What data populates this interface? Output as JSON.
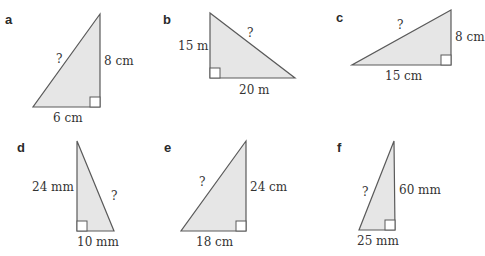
{
  "colors": {
    "triangle_fill": "#e6e6e6",
    "triangle_stroke": "#5a5a5a",
    "text": "#333333"
  },
  "problems": [
    {
      "label": "a",
      "hypotenuse": "?",
      "leg_vertical": "8 cm",
      "leg_horizontal": "6 cm"
    },
    {
      "label": "b",
      "hypotenuse": "?",
      "leg_vertical": "15 m",
      "leg_horizontal": "20 m"
    },
    {
      "label": "c",
      "hypotenuse": "?",
      "leg_vertical": "8 cm",
      "leg_horizontal": "15 cm"
    },
    {
      "label": "d",
      "hypotenuse": "?",
      "leg_vertical": "24 mm",
      "leg_horizontal": "10 mm"
    },
    {
      "label": "e",
      "hypotenuse": "?",
      "leg_vertical": "24 cm",
      "leg_horizontal": "18 cm"
    },
    {
      "label": "f",
      "hypotenuse": "?",
      "leg_vertical": "60 mm",
      "leg_horizontal": "25 mm"
    }
  ]
}
